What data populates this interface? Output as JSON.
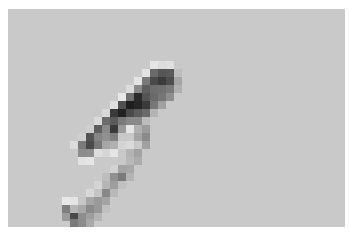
{
  "image": {
    "description": "Pixelated grayscale image of a dark elongated diagonal object on a light gray background",
    "background_color": "#c9c9c9",
    "border_color": "#ffffff",
    "cell_size": 8,
    "origin": [
      8,
      9
    ],
    "cells": [
      [
        150,
        61,
        "#e6e6e6"
      ],
      [
        158,
        61,
        "#dddddd"
      ],
      [
        166,
        61,
        "#e0e0e0"
      ],
      [
        142,
        69,
        "#e2e2e2"
      ],
      [
        150,
        69,
        "#6a6a6a"
      ],
      [
        158,
        69,
        "#555555"
      ],
      [
        166,
        69,
        "#5a5a5a"
      ],
      [
        174,
        69,
        "#bdbdbd"
      ],
      [
        134,
        77,
        "#e4e4e4"
      ],
      [
        142,
        77,
        "#7a7a7a"
      ],
      [
        150,
        77,
        "#4a4a4a"
      ],
      [
        158,
        77,
        "#3c3c3c"
      ],
      [
        166,
        77,
        "#4e4e4e"
      ],
      [
        174,
        77,
        "#a5a5a5"
      ],
      [
        126,
        85,
        "#dcdcdc"
      ],
      [
        134,
        85,
        "#8a8a8a"
      ],
      [
        142,
        85,
        "#5e5e5e"
      ],
      [
        150,
        85,
        "#6e6e6e"
      ],
      [
        158,
        85,
        "#707070"
      ],
      [
        166,
        85,
        "#7a7a7a"
      ],
      [
        174,
        85,
        "#b0b0b0"
      ],
      [
        118,
        93,
        "#e8e8e8"
      ],
      [
        126,
        93,
        "#707070"
      ],
      [
        134,
        93,
        "#2a2a2a"
      ],
      [
        142,
        93,
        "#555555"
      ],
      [
        150,
        93,
        "#6a6a6a"
      ],
      [
        158,
        93,
        "#767676"
      ],
      [
        166,
        93,
        "#8e8e8e"
      ],
      [
        110,
        101,
        "#e0e0e0"
      ],
      [
        118,
        101,
        "#505050"
      ],
      [
        126,
        101,
        "#1e1e1e"
      ],
      [
        134,
        101,
        "#262626"
      ],
      [
        142,
        101,
        "#3a3a3a"
      ],
      [
        150,
        101,
        "#777777"
      ],
      [
        158,
        101,
        "#a0a0a0"
      ],
      [
        102,
        109,
        "#d8d8d8"
      ],
      [
        110,
        109,
        "#3a3a3a"
      ],
      [
        118,
        109,
        "#222222"
      ],
      [
        126,
        109,
        "#4a4a4a"
      ],
      [
        134,
        109,
        "#5c5c5c"
      ],
      [
        142,
        109,
        "#6a6a6a"
      ],
      [
        150,
        109,
        "#b4b4b4"
      ],
      [
        94,
        117,
        "#dadada"
      ],
      [
        102,
        117,
        "#6c6c6c"
      ],
      [
        110,
        117,
        "#5a5a5a"
      ],
      [
        118,
        117,
        "#7a7a7a"
      ],
      [
        126,
        117,
        "#888888"
      ],
      [
        134,
        117,
        "#8a8a8a"
      ],
      [
        142,
        117,
        "#bcbcbc"
      ],
      [
        86,
        125,
        "#cfcfcf"
      ],
      [
        94,
        125,
        "#5e5e5e"
      ],
      [
        102,
        125,
        "#8a8a8a"
      ],
      [
        110,
        125,
        "#3a3a3a"
      ],
      [
        118,
        125,
        "#9a9a9a"
      ],
      [
        126,
        125,
        "#e4e4e4"
      ],
      [
        134,
        125,
        "#b0b0b0"
      ],
      [
        142,
        125,
        "#9c9c9c"
      ],
      [
        70,
        141,
        "#dcdcdc"
      ],
      [
        78,
        141,
        "#7a7a7a"
      ],
      [
        86,
        141,
        "#4a4a4a"
      ],
      [
        94,
        141,
        "#777777"
      ],
      [
        102,
        141,
        "#a6a6a6"
      ],
      [
        110,
        141,
        "#b0b0b0"
      ],
      [
        118,
        141,
        "#d4d4d4"
      ],
      [
        126,
        141,
        "#dadada"
      ],
      [
        142,
        141,
        "#a0a0a0"
      ],
      [
        78,
        133,
        "#d0d0d0"
      ],
      [
        86,
        133,
        "#555555"
      ],
      [
        94,
        133,
        "#858585"
      ],
      [
        102,
        133,
        "#909090"
      ],
      [
        110,
        133,
        "#7e7e7e"
      ],
      [
        118,
        133,
        "#c8c8c8"
      ],
      [
        134,
        133,
        "#a4a4a4"
      ],
      [
        142,
        133,
        "#8a8a8a"
      ],
      [
        78,
        149,
        "#8c8c8c"
      ],
      [
        86,
        149,
        "#8e8e8e"
      ],
      [
        94,
        149,
        "#dedede"
      ],
      [
        102,
        149,
        "#d6d6d6"
      ],
      [
        110,
        149,
        "#e4e4e4"
      ],
      [
        126,
        149,
        "#b4b4b4"
      ],
      [
        134,
        149,
        "#a2a2a2"
      ],
      [
        78,
        157,
        "#e2e2e2"
      ],
      [
        86,
        157,
        "#e6e6e6"
      ],
      [
        118,
        157,
        "#c8c8c8"
      ],
      [
        126,
        157,
        "#b8b8b8"
      ],
      [
        134,
        157,
        "#acacac"
      ],
      [
        110,
        165,
        "#d2d2d2"
      ],
      [
        118,
        165,
        "#a4a4a4"
      ],
      [
        126,
        165,
        "#a8a8a8"
      ],
      [
        102,
        173,
        "#bebebe"
      ],
      [
        110,
        173,
        "#909090"
      ],
      [
        118,
        173,
        "#7a7a7a"
      ],
      [
        126,
        173,
        "#b4b4b4"
      ],
      [
        94,
        181,
        "#d4d4d4"
      ],
      [
        102,
        181,
        "#b6b6b6"
      ],
      [
        110,
        181,
        "#9e9e9e"
      ],
      [
        118,
        181,
        "#c0c0c0"
      ],
      [
        86,
        189,
        "#d8d8d8"
      ],
      [
        94,
        189,
        "#c4c4c4"
      ],
      [
        102,
        189,
        "#888888"
      ],
      [
        110,
        189,
        "#b8b8b8"
      ],
      [
        62,
        197,
        "#e8e8e8"
      ],
      [
        70,
        197,
        "#e4e4e4"
      ],
      [
        78,
        197,
        "#c6c6c6"
      ],
      [
        86,
        197,
        "#a6a6a6"
      ],
      [
        94,
        197,
        "#9a9a9a"
      ],
      [
        102,
        197,
        "#a4a4a4"
      ],
      [
        62,
        205,
        "#7e7e7e"
      ],
      [
        70,
        205,
        "#b6b6b6"
      ],
      [
        78,
        205,
        "#a8a8a8"
      ],
      [
        86,
        205,
        "#8a8a8a"
      ],
      [
        94,
        205,
        "#989898"
      ],
      [
        102,
        205,
        "#c0c0c0"
      ],
      [
        62,
        213,
        "#9a9a9a"
      ],
      [
        70,
        213,
        "#4a4a4a"
      ],
      [
        78,
        213,
        "#8e8e8e"
      ],
      [
        86,
        213,
        "#9e9e9e"
      ],
      [
        94,
        213,
        "#b4b4b4"
      ],
      [
        70,
        219,
        "#7a7a7a"
      ],
      [
        78,
        219,
        "#8c8c8c"
      ],
      [
        86,
        219,
        "#a8a8a8"
      ]
    ]
  }
}
